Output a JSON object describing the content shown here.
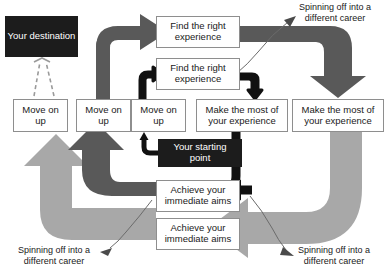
{
  "diagram": {
    "colors": {
      "inner_arrow": "#111111",
      "middle_arrow": "#595959",
      "outer_arrow": "#a8a8a8",
      "dark_box_bg": "#1c1c1c",
      "dark_box_text": "#ffffff",
      "box_border": "#8e8e8e",
      "box_text": "#1a1a1a",
      "leader_line": "#6b6b6b",
      "dashed_line": "#9a9a9a",
      "background": "#ffffff"
    },
    "nodes": [
      {
        "id": "destination",
        "label": "Your destination",
        "style": "dark",
        "x": 5,
        "y": 16,
        "w": 73,
        "h": 41
      },
      {
        "id": "find-1",
        "label": "Find the right\nexperience",
        "style": "box",
        "x": 156,
        "y": 16,
        "w": 84,
        "h": 32
      },
      {
        "id": "find-2",
        "label": "Find the right\nexperience",
        "style": "box",
        "x": 156,
        "y": 58,
        "w": 84,
        "h": 32
      },
      {
        "id": "move-1",
        "label": "Move on\nup",
        "style": "box",
        "x": 13,
        "y": 99,
        "w": 55,
        "h": 33
      },
      {
        "id": "move-2",
        "label": "Move on\nup",
        "style": "box",
        "x": 76,
        "y": 99,
        "w": 55,
        "h": 33
      },
      {
        "id": "move-3",
        "label": "Move on\nup",
        "style": "box",
        "x": 131,
        "y": 99,
        "w": 55,
        "h": 33
      },
      {
        "id": "make-1",
        "label": "Make the most of\nyour experience",
        "style": "box",
        "x": 196,
        "y": 99,
        "w": 92,
        "h": 33
      },
      {
        "id": "make-2",
        "label": "Make the most of\nyour experience",
        "style": "box",
        "x": 292,
        "y": 99,
        "w": 92,
        "h": 33
      },
      {
        "id": "starting-point",
        "label": "Your starting\npoint",
        "style": "dark",
        "x": 158,
        "y": 139,
        "w": 84,
        "h": 28
      },
      {
        "id": "achieve-1",
        "label": "Achieve your\nimmediate aims",
        "style": "box",
        "x": 156,
        "y": 180,
        "w": 84,
        "h": 32
      },
      {
        "id": "achieve-2",
        "label": "Achieve your\nimmediate aims",
        "style": "box",
        "x": 156,
        "y": 218,
        "w": 84,
        "h": 32
      }
    ],
    "captions": [
      {
        "id": "spinoff-top-right",
        "text": "Spinning off into a\ndifferent career",
        "x": 286,
        "y": 2,
        "w": 98
      },
      {
        "id": "spinoff-bottom-right",
        "text": "Spinning off into a\ndifferent career",
        "x": 284,
        "y": 245,
        "w": 100
      },
      {
        "id": "spinoff-bottom-left",
        "text": "Spinning off into a\ndifferent career",
        "x": 2,
        "y": 245,
        "w": 104
      }
    ],
    "arrow_labels": {
      "inner_cycle": "inner career cycle",
      "middle_cycle": "middle career cycle",
      "outer_cycle": "outer career cycle"
    }
  }
}
